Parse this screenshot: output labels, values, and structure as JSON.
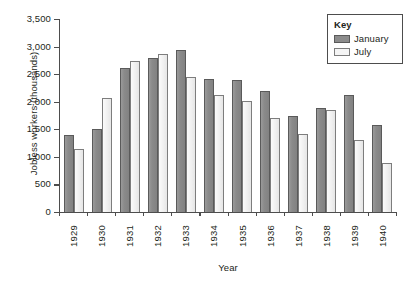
{
  "chart_data": {
    "type": "bar",
    "title": "",
    "xlabel": "Year",
    "ylabel": "Jobless workers (thousands)",
    "categories": [
      "1929",
      "1930",
      "1931",
      "1932",
      "1933",
      "1934",
      "1935",
      "1936",
      "1937",
      "1938",
      "1939",
      "1940"
    ],
    "series": [
      {
        "name": "January",
        "color": "#8c8c8c",
        "values": [
          1400,
          1500,
          2610,
          2790,
          2940,
          2420,
          2390,
          2190,
          1740,
          1880,
          2120,
          1570
        ]
      },
      {
        "name": "July",
        "color": "#f2f2f2",
        "values": [
          1150,
          2060,
          2730,
          2860,
          2440,
          2130,
          2010,
          1700,
          1420,
          1850,
          1310,
          880
        ]
      }
    ],
    "ylim": [
      0,
      3500
    ],
    "ytick_values": [
      0,
      500,
      1000,
      1500,
      2000,
      2500,
      3000,
      3500
    ],
    "ytick_labels": [
      "0",
      "500",
      "1,000",
      "1,500",
      "2,000",
      "2,500",
      "3,000",
      "3,500"
    ],
    "grid": false,
    "legend_position": "top-right"
  },
  "legend": {
    "title": "Key",
    "entries": [
      {
        "label": "January"
      },
      {
        "label": "July"
      }
    ]
  }
}
